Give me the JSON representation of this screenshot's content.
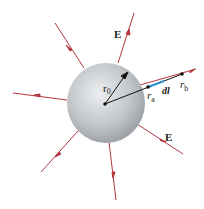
{
  "diagram": {
    "labels": {
      "E_top": "E",
      "E_bottom": "E",
      "r0": "r",
      "r0_sub": "0",
      "ra": "r",
      "ra_sub": "a",
      "rb": "r",
      "rb_sub": "b",
      "dl": "dl"
    },
    "colors": {
      "field_line": "#b5363f",
      "radius_line": "#111111",
      "dl_vector": "#2a8fd6",
      "sphere_light": "#e4e6e8",
      "sphere_dark": "#9a9ea3"
    }
  }
}
